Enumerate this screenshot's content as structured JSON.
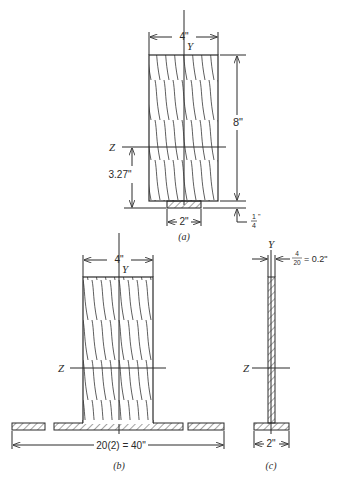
{
  "figure_a": {
    "caption": "(a)",
    "y_axis_label": "Y",
    "z_axis_label": "Z",
    "width_dim": "4\"",
    "height_dim": "8\"",
    "neutral_axis_dim": "3.27\"",
    "plate_width_dim": "2\"",
    "plate_thickness_num": "1",
    "plate_thickness_den": "4",
    "plate_thickness_unit": "\""
  },
  "figure_b": {
    "caption": "(b)",
    "y_axis_label": "Y",
    "z_axis_label": "Z",
    "width_dim": "4\"",
    "flange_width_dim": "20(2) = 40\""
  },
  "figure_c": {
    "caption": "(c)",
    "y_axis_label": "Y",
    "z_axis_label": "Z",
    "web_num": "4",
    "web_den": "20",
    "web_dim_value": "= 0.2\"",
    "flange_width_dim": "2\""
  },
  "colors": {
    "line": "#2a2a2a",
    "background": "#ffffff"
  }
}
